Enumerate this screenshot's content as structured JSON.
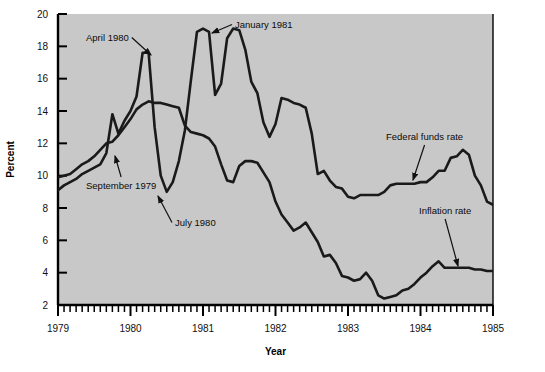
{
  "chart_data": {
    "type": "line",
    "title": "",
    "xlabel": "Year",
    "ylabel": "Percent",
    "xlim": [
      1979.0,
      1985.0
    ],
    "ylim": [
      2,
      20
    ],
    "yticks": [
      2,
      4,
      6,
      8,
      10,
      12,
      14,
      16,
      18,
      20
    ],
    "ytick_labels": [
      "2",
      "4",
      "6",
      "8",
      "10",
      "12",
      "14",
      "16",
      "18",
      "20"
    ],
    "xticks": [
      1979,
      1980,
      1981,
      1982,
      1983,
      1984,
      1985
    ],
    "xtick_labels": [
      "1979",
      "1980",
      "1981",
      "1982",
      "1983",
      "1984",
      "1985"
    ],
    "minor_xticks_per_year": 12,
    "grid": false,
    "legend_position": "inline-annotations",
    "plot_background": "#c8c8c8",
    "line_color": "#1a1a1a",
    "series": [
      {
        "name": "Federal funds rate",
        "x": [
          1979.0,
          1979.083,
          1979.167,
          1979.25,
          1979.333,
          1979.417,
          1979.5,
          1979.583,
          1979.667,
          1979.75,
          1979.833,
          1979.917,
          1980.0,
          1980.083,
          1980.167,
          1980.25,
          1980.333,
          1980.417,
          1980.5,
          1980.583,
          1980.667,
          1980.75,
          1980.833,
          1980.917,
          1981.0,
          1981.083,
          1981.167,
          1981.25,
          1981.333,
          1981.417,
          1981.5,
          1981.583,
          1981.667,
          1981.75,
          1981.833,
          1981.917,
          1982.0,
          1982.083,
          1982.167,
          1982.25,
          1982.333,
          1982.417,
          1982.5,
          1982.583,
          1982.667,
          1982.75,
          1982.833,
          1982.917,
          1983.0,
          1983.083,
          1983.167,
          1983.25,
          1983.333,
          1983.417,
          1983.5,
          1983.583,
          1983.667,
          1983.75,
          1983.833,
          1983.917,
          1984.0,
          1984.083,
          1984.167,
          1984.25,
          1984.333,
          1984.417,
          1984.5,
          1984.583,
          1984.667,
          1984.75,
          1984.833,
          1984.917,
          1985.0
        ],
        "values": [
          9.1,
          9.4,
          9.6,
          9.8,
          10.1,
          10.3,
          10.5,
          10.7,
          11.4,
          13.8,
          12.6,
          13.4,
          14.0,
          14.9,
          17.6,
          17.6,
          13.0,
          10.0,
          9.0,
          9.6,
          10.9,
          12.8,
          15.9,
          18.9,
          19.1,
          18.9,
          15.0,
          15.7,
          18.5,
          19.1,
          19.0,
          17.8,
          15.8,
          15.1,
          13.3,
          12.4,
          13.2,
          14.8,
          14.7,
          14.5,
          14.4,
          14.2,
          12.6,
          10.1,
          10.3,
          9.7,
          9.3,
          9.2,
          8.7,
          8.6,
          8.8,
          8.8,
          8.8,
          8.8,
          9.0,
          9.4,
          9.5,
          9.5,
          9.5,
          9.5,
          9.6,
          9.6,
          9.9,
          10.3,
          10.3,
          11.1,
          11.2,
          11.6,
          11.3,
          10.0,
          9.4,
          8.4,
          8.2
        ]
      },
      {
        "name": "Inflation rate",
        "x": [
          1979.0,
          1979.083,
          1979.167,
          1979.25,
          1979.333,
          1979.417,
          1979.5,
          1979.583,
          1979.667,
          1979.75,
          1979.833,
          1979.917,
          1980.0,
          1980.083,
          1980.167,
          1980.25,
          1980.333,
          1980.417,
          1980.5,
          1980.583,
          1980.667,
          1980.75,
          1980.833,
          1980.917,
          1981.0,
          1981.083,
          1981.167,
          1981.25,
          1981.333,
          1981.417,
          1981.5,
          1981.583,
          1981.667,
          1981.75,
          1981.833,
          1981.917,
          1982.0,
          1982.083,
          1982.167,
          1982.25,
          1982.333,
          1982.417,
          1982.5,
          1982.583,
          1982.667,
          1982.75,
          1982.833,
          1982.917,
          1983.0,
          1983.083,
          1983.167,
          1983.25,
          1983.333,
          1983.417,
          1983.5,
          1983.583,
          1983.667,
          1983.75,
          1983.833,
          1983.917,
          1984.0,
          1984.083,
          1984.167,
          1984.25,
          1984.333,
          1984.417,
          1984.5,
          1984.583,
          1984.667,
          1984.75,
          1984.833,
          1984.917,
          1985.0
        ],
        "values": [
          9.9,
          10.0,
          10.1,
          10.4,
          10.7,
          10.9,
          11.2,
          11.6,
          12.0,
          12.1,
          12.5,
          13.0,
          13.5,
          14.1,
          14.4,
          14.6,
          14.5,
          14.5,
          14.4,
          14.3,
          14.2,
          13.1,
          12.7,
          12.6,
          12.5,
          12.3,
          11.8,
          10.7,
          9.7,
          9.6,
          10.6,
          10.9,
          10.9,
          10.8,
          10.2,
          9.6,
          8.4,
          7.6,
          7.1,
          6.6,
          6.8,
          7.1,
          6.5,
          5.9,
          5.0,
          5.1,
          4.6,
          3.8,
          3.7,
          3.5,
          3.6,
          4.0,
          3.5,
          2.6,
          2.4,
          2.5,
          2.6,
          2.9,
          3.0,
          3.3,
          3.7,
          4.0,
          4.4,
          4.7,
          4.3,
          4.3,
          4.3,
          4.3,
          4.3,
          4.2,
          4.2,
          4.1,
          4.1
        ]
      }
    ],
    "annotations": [
      {
        "text": "April 1980",
        "label_x": 86,
        "label_y": 41,
        "arrow_to_x": 151,
        "arrow_to_y": 55
      },
      {
        "text": "September 1979",
        "label_x": 86,
        "label_y": 189,
        "arrow_to_x": 115,
        "arrow_to_y": 156
      },
      {
        "text": "July 1980",
        "label_x": 175,
        "label_y": 226,
        "arrow_to_x": 158,
        "arrow_to_y": 196
      },
      {
        "text": "January 1981",
        "label_x": 235,
        "label_y": 28,
        "arrow_to_x": 212,
        "arrow_to_y": 33
      },
      {
        "text": "Federal funds rate",
        "label_x": 386,
        "label_y": 140,
        "arrow_to_x": 413,
        "arrow_to_y": 180
      },
      {
        "text": "Inflation rate",
        "label_x": 419,
        "label_y": 214,
        "arrow_to_x": 458,
        "arrow_to_y": 266
      }
    ]
  }
}
